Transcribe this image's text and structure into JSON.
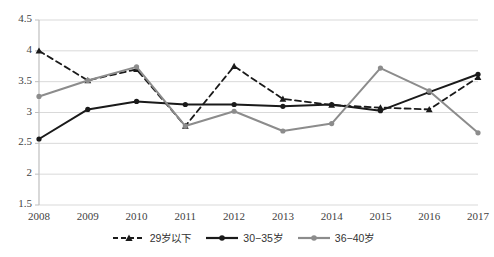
{
  "chart_data": {
    "type": "line",
    "title": "",
    "xlabel": "",
    "ylabel": "",
    "categories": [
      "2008",
      "2009",
      "2010",
      "2011",
      "2012",
      "2013",
      "2014",
      "2015",
      "2016",
      "2017"
    ],
    "ylim": [
      1.5,
      4.5
    ],
    "ytick_step": 0.5,
    "yticks": [
      "1.5",
      "2",
      "2.5",
      "3",
      "3.5",
      "4",
      "4.5"
    ],
    "grid": true,
    "legend_position": "bottom",
    "series": [
      {
        "name": "29岁以下",
        "values": [
          4.0,
          3.52,
          3.7,
          2.78,
          3.75,
          3.22,
          3.12,
          3.08,
          3.05,
          3.57
        ],
        "color": "#1a1a1a",
        "style": "dashed",
        "marker": "triangle"
      },
      {
        "name": "30−35岁",
        "values": [
          2.57,
          3.05,
          3.18,
          3.13,
          3.13,
          3.1,
          3.13,
          3.03,
          3.33,
          3.62
        ],
        "color": "#1a1a1a",
        "style": "solid",
        "marker": "circle"
      },
      {
        "name": "36−40岁",
        "values": [
          3.26,
          3.52,
          3.74,
          2.78,
          3.02,
          2.7,
          2.82,
          3.72,
          3.35,
          2.67
        ],
        "color": "#8c8c8c",
        "style": "solid",
        "marker": "circle"
      }
    ]
  },
  "legend": {
    "items": [
      {
        "label": "29岁以下"
      },
      {
        "label": "30−35岁"
      },
      {
        "label": "36−40岁"
      }
    ]
  },
  "axes": {
    "y_ticks": [
      "4.5",
      "4",
      "3.5",
      "3",
      "2.5",
      "2",
      "1.5"
    ],
    "x_ticks": [
      "2008",
      "2009",
      "2010",
      "2011",
      "2012",
      "2013",
      "2014",
      "2015",
      "2016",
      "2017"
    ]
  },
  "colors": {
    "series_dark": "#1a1a1a",
    "series_gray": "#8c8c8c",
    "gridline": "#d9d9d9",
    "axis": "#bfbfbf",
    "tick_text": "#3f3f3f"
  }
}
